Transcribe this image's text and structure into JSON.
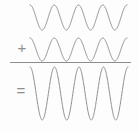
{
  "figure": {
    "background_color": "#fdfdfd",
    "width": 139,
    "height": 132
  },
  "operators": {
    "plus": "+",
    "equals": "="
  },
  "divider": {
    "name": "summation-bar",
    "color": "#8d8d8d",
    "x1": 10,
    "x2": 131,
    "y": 62.5,
    "thickness": 1.1
  },
  "style": {
    "stroke_color": "#8d8d8d",
    "stroke_width": 1.0,
    "fill": "none"
  },
  "chart_data": {
    "type": "line",
    "subtitle": "",
    "xlabel": "",
    "ylabel": "",
    "grid": false,
    "legend": "none",
    "axis_visible": false,
    "xlim": [
      0,
      4
    ],
    "ylim": [
      -2.2,
      2.2
    ],
    "annotations": [
      "+",
      "="
    ],
    "series": [
      {
        "name": "wave-1",
        "role": "addend",
        "waveform": "cosine",
        "amplitude": 1.0,
        "cycles": 4,
        "phase_deg": 0,
        "x_start_px": 30,
        "x_end_px": 127,
        "baseline_y_px": 17.5,
        "amplitude_px": 12.5,
        "color": "#8d8d8d"
      },
      {
        "name": "wave-2",
        "role": "addend",
        "waveform": "cosine",
        "amplitude": 1.0,
        "cycles": 4,
        "phase_deg": 0,
        "x_start_px": 30,
        "x_end_px": 127,
        "baseline_y_px": 49.5,
        "amplitude_px": 11.5,
        "color": "#8d8d8d"
      },
      {
        "name": "wave-sum",
        "role": "result",
        "waveform": "cosine",
        "amplitude": 2.0,
        "cycles": 4,
        "phase_deg": 0,
        "x_start_px": 30,
        "x_end_px": 128,
        "baseline_y_px": 93.5,
        "amplitude_px": 26.5,
        "color": "#8d8d8d"
      }
    ]
  }
}
